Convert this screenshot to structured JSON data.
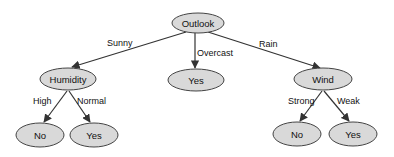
{
  "diagram": {
    "type": "decision-tree",
    "colors": {
      "node_fill": "#d9d9d9",
      "node_stroke": "#444444",
      "edge": "#333333",
      "text": "#111111"
    },
    "nodes": {
      "root": {
        "label": "Outlook",
        "cx": 198,
        "cy": 23,
        "rx": 26,
        "ry": 10
      },
      "humidity": {
        "label": "Humidity",
        "cx": 68,
        "cy": 79,
        "rx": 28,
        "ry": 11
      },
      "overcast_leaf": {
        "label": "Yes",
        "cx": 196,
        "cy": 80,
        "rx": 28,
        "ry": 11
      },
      "wind": {
        "label": "Wind",
        "cx": 323,
        "cy": 79,
        "rx": 29,
        "ry": 11
      },
      "humidity_high_leaf": {
        "label": "No",
        "cx": 40,
        "cy": 135,
        "rx": 24,
        "ry": 12
      },
      "humidity_normal_leaf": {
        "label": "Yes",
        "cx": 94,
        "cy": 135,
        "rx": 24,
        "ry": 12
      },
      "wind_strong_leaf": {
        "label": "No",
        "cx": 297,
        "cy": 134,
        "rx": 24,
        "ry": 12
      },
      "wind_weak_leaf": {
        "label": "Yes",
        "cx": 353,
        "cy": 134,
        "rx": 24,
        "ry": 12
      }
    },
    "edges": {
      "sunny": {
        "label": "Sunny"
      },
      "overcast": {
        "label": "Overcast"
      },
      "rain": {
        "label": "Rain"
      },
      "high": {
        "label": "High"
      },
      "normal": {
        "label": "Normal"
      },
      "strong": {
        "label": "Strong"
      },
      "weak": {
        "label": "Weak"
      }
    }
  }
}
